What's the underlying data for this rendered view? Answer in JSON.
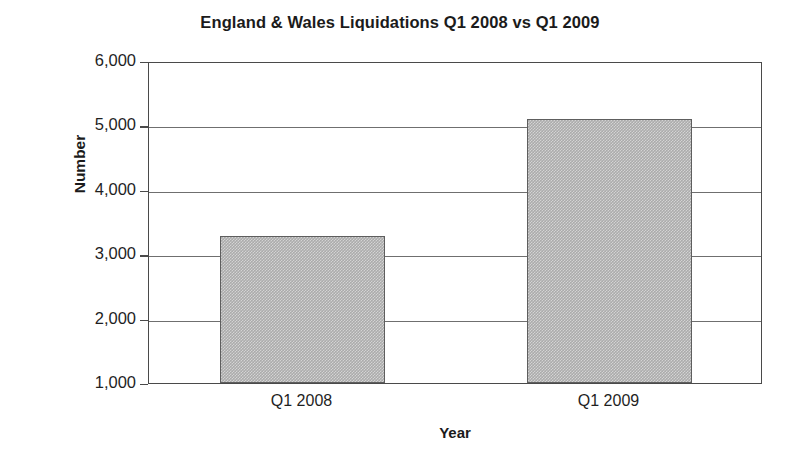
{
  "chart_data": {
    "type": "bar",
    "title": "England & Wales Liquidations Q1 2008 vs Q1 2009",
    "xlabel": "Year",
    "ylabel": "Number",
    "categories": [
      "Q1 2008",
      "Q1 2009"
    ],
    "values": [
      3280,
      5100
    ],
    "ylim": [
      1000,
      6000
    ],
    "ytick_step": 1000,
    "ytick_labels": [
      "1,000",
      "2,000",
      "3,000",
      "4,000",
      "5,000",
      "6,000"
    ],
    "ytick_values": [
      1000,
      2000,
      3000,
      4000,
      5000,
      6000
    ],
    "grid": true,
    "legend": false,
    "bar_fill_color": "#ababab",
    "bar_border_color": "#5e5e5e",
    "axis_color": "#4a4a4a",
    "gridline_color": "#6f6f6f",
    "background_color": "#ffffff",
    "text_color": "#1b1b1b"
  }
}
